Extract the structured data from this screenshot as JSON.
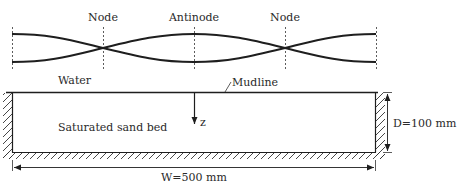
{
  "diagram": {
    "type": "standing-wave-over-sand-bed",
    "wave": {
      "labels": {
        "node_left": "Node",
        "antinode": "Antinode",
        "node_right": "Node"
      }
    },
    "regions": {
      "water": "Water",
      "mudline": "Mudline",
      "sand": "Saturated sand bed"
    },
    "axis": {
      "z_label": "z"
    },
    "dimensions": {
      "depth": "D=100 mm",
      "width": "W=500 mm"
    },
    "colors": {
      "ink": "#1e1e1e",
      "background": "#ffffff"
    }
  }
}
